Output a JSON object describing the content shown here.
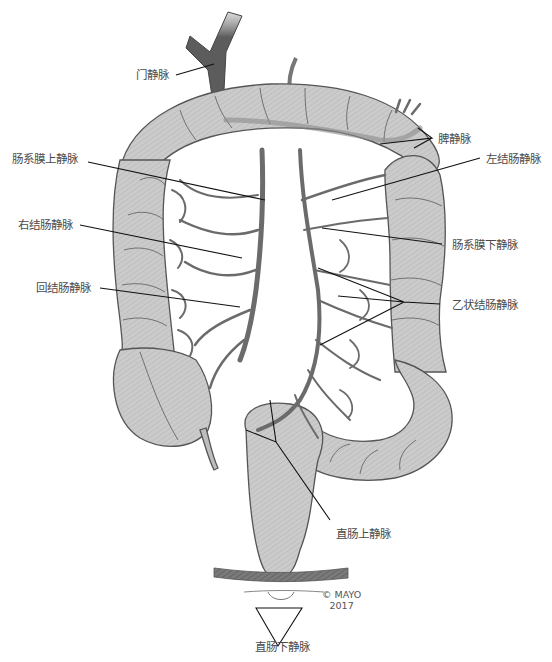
{
  "figure": {
    "type": "anatomical-illustration",
    "colors": {
      "colon_fill": "#c9c9c9",
      "colon_outline": "#555555",
      "vein": "#6b6b6b",
      "portal_vein": "#5a5a5a",
      "leader_line": "#111111",
      "label_text": "#4a4a4a",
      "pelvic_floor": "#777777"
    }
  },
  "labels": {
    "portal_vein": "门静脉",
    "splenic_vein": "脾静脉",
    "superior_mesenteric_vein": "肠系膜上静脉",
    "left_colic_vein": "左结肠静脉",
    "right_colic_vein": "右结肠静脉",
    "inferior_mesenteric_vein": "肠系膜下静脉",
    "ileocolic_vein": "回结肠静脉",
    "sigmoid_veins": "乙状结肠静脉",
    "superior_rectal_vein": "直肠上静脉",
    "inferior_rectal_vein": "直肠下静脉"
  },
  "copyright": {
    "line1": "© MAYO",
    "line2": "2017"
  }
}
